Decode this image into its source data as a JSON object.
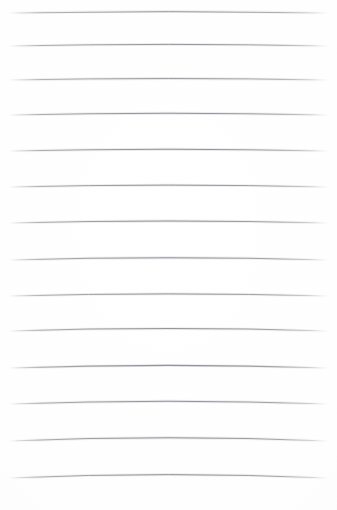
{
  "document": {
    "kind": "lined-paper-sheet",
    "title": "Blank ruled notepad page",
    "content_text": "",
    "has_handwriting": false,
    "has_margin_rule": false,
    "has_header": false,
    "has_punch_holes": false
  },
  "canvas": {
    "width": 337,
    "height": 510,
    "background_color": "#fefefe",
    "paper_tint_color": "#fafafa"
  },
  "ruling": {
    "line_count": 14,
    "line_color": "#9d9da1",
    "line_color_light": "#c9c9cd",
    "line_color_dark": "#8b8b90",
    "stroke_width": 1.1,
    "left_x": 9,
    "right_x": 328,
    "first_line_y": 13,
    "last_line_y": 478,
    "spacing": 35.8,
    "orientation": "horizontal",
    "style": "scanned-ruled-faint-bowed",
    "fade_at_ends": true
  },
  "lines": [
    {
      "index": 1,
      "y": 13,
      "bow": -1.4,
      "weight": 0.8,
      "label": "rule-line-1"
    },
    {
      "index": 2,
      "y": 46,
      "bow": -1.6,
      "weight": 0.86,
      "label": "rule-line-2"
    },
    {
      "index": 3,
      "y": 80,
      "bow": -1.5,
      "weight": 0.82,
      "label": "rule-line-3"
    },
    {
      "index": 4,
      "y": 115,
      "bow": -1.8,
      "weight": 0.92,
      "label": "rule-line-4"
    },
    {
      "index": 5,
      "y": 151,
      "bow": -1.7,
      "weight": 0.95,
      "label": "rule-line-5"
    },
    {
      "index": 6,
      "y": 187,
      "bow": -1.9,
      "weight": 0.9,
      "label": "rule-line-6"
    },
    {
      "index": 7,
      "y": 223,
      "bow": -2.0,
      "weight": 1.0,
      "label": "rule-line-7"
    },
    {
      "index": 8,
      "y": 260,
      "bow": -2.2,
      "weight": 0.96,
      "label": "rule-line-8"
    },
    {
      "index": 9,
      "y": 296,
      "bow": -2.1,
      "weight": 0.88,
      "label": "rule-line-9"
    },
    {
      "index": 10,
      "y": 331,
      "bow": -2.4,
      "weight": 0.94,
      "label": "rule-line-10"
    },
    {
      "index": 11,
      "y": 368,
      "bow": -2.6,
      "weight": 1.0,
      "label": "rule-line-11"
    },
    {
      "index": 12,
      "y": 404,
      "bow": -2.8,
      "weight": 0.97,
      "label": "rule-line-12"
    },
    {
      "index": 13,
      "y": 441,
      "bow": -3.2,
      "weight": 0.93,
      "label": "rule-line-13"
    },
    {
      "index": 14,
      "y": 478,
      "bow": -3.4,
      "weight": 0.9,
      "label": "rule-line-14"
    }
  ]
}
